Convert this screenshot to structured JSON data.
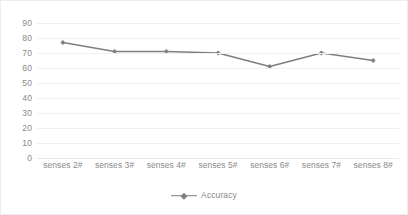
{
  "chart_data": {
    "type": "line",
    "title": "",
    "xlabel": "",
    "ylabel": "",
    "categories": [
      "senses 2#",
      "senses 3#",
      "senses 4#",
      "senses 5#",
      "senses 6#",
      "senses 7#",
      "senses 8#"
    ],
    "series": [
      {
        "name": "Accuracy",
        "values": [
          77,
          71,
          71,
          70,
          61,
          70,
          65
        ],
        "color": "#7f7f7f",
        "marker": "diamond"
      }
    ],
    "ylim": [
      0,
      90
    ],
    "ytick_step": 10,
    "ytick_labels": [
      "90",
      "80",
      "70",
      "60",
      "50",
      "40",
      "30",
      "20",
      "10",
      "0"
    ],
    "grid": true,
    "legend_position": "bottom"
  },
  "legend": {
    "entries": [
      {
        "label": "Accuracy"
      }
    ]
  },
  "colors": {
    "series": "#7f7f7f",
    "gridline": "#f0f0f0",
    "text": "#8a8a8a",
    "border": "#ededed"
  }
}
